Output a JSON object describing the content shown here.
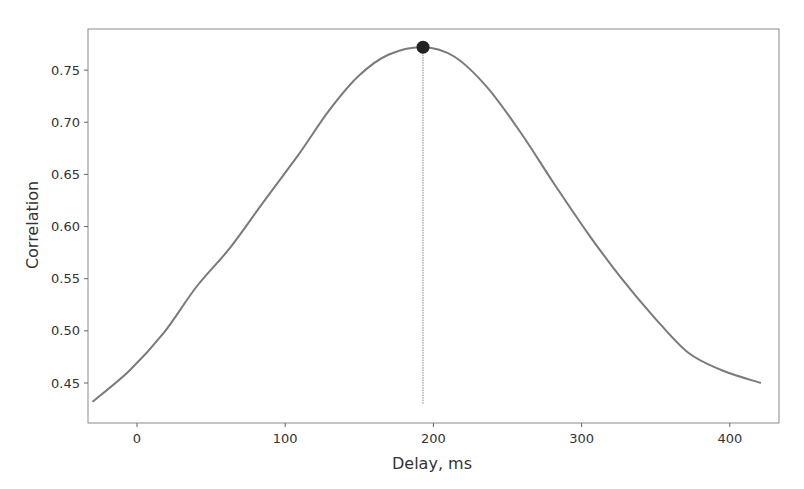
{
  "chart_data": {
    "type": "line",
    "title": "",
    "xlabel": "Delay, ms",
    "ylabel": "Correlation",
    "xlim": [
      -35,
      430
    ],
    "ylim": [
      0.414,
      0.79
    ],
    "x_ticks": [
      0,
      100,
      200,
      300,
      400
    ],
    "x_tick_labels": [
      "0",
      "100",
      "200",
      "300",
      "400"
    ],
    "y_ticks": [
      0.45,
      0.5,
      0.55,
      0.6,
      0.65,
      0.7,
      0.75
    ],
    "y_tick_labels": [
      "0.45",
      "0.50",
      "0.55",
      "0.60",
      "0.65",
      "0.70",
      "0.75"
    ],
    "grid": false,
    "legend": null,
    "series": [
      {
        "name": "correlation",
        "color": "#7a7a7a",
        "x": [
          -30,
          -5,
          18,
          40,
          63,
          85,
          108,
          130,
          150,
          170,
          193,
          214,
          236,
          259,
          281,
          304,
          326,
          349,
          372,
          395,
          421
        ],
        "values": [
          0.432,
          0.462,
          0.498,
          0.542,
          0.58,
          0.623,
          0.667,
          0.712,
          0.745,
          0.765,
          0.772,
          0.763,
          0.734,
          0.69,
          0.642,
          0.594,
          0.552,
          0.513,
          0.479,
          0.462,
          0.45
        ]
      }
    ],
    "annotations": [
      {
        "type": "marker",
        "label": "peak",
        "x": 193,
        "y": 0.772,
        "color": "#222222"
      },
      {
        "type": "vline",
        "x": 193,
        "ymin": 0.432,
        "ymax": 0.772,
        "color": "#888888"
      }
    ]
  }
}
